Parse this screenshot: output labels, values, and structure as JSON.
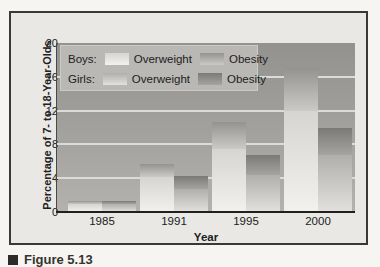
{
  "figure": {
    "caption": "Figure 5.13",
    "caption_marker": "square-bullet"
  },
  "chart_data": {
    "type": "bar",
    "stacked": true,
    "title": "",
    "xlabel": "Year",
    "ylabel": "Percentage of 7- to 18-Year-Olds",
    "categories": [
      "1985",
      "1991",
      "1995",
      "2000"
    ],
    "yticks": [
      0,
      4,
      8,
      12,
      16,
      20
    ],
    "ylim": [
      0,
      20
    ],
    "grid": "horizontal light lines at 4, 8, 12, 16",
    "legend_position": "top-left inside plot",
    "legend_rows": [
      {
        "group_label": "Boys:",
        "items": [
          {
            "label": "Overweight",
            "series_key": "boys_overweight"
          },
          {
            "label": "Obesity",
            "series_key": "boys_obesity"
          }
        ]
      },
      {
        "group_label": "Girls:",
        "items": [
          {
            "label": "Overweight",
            "series_key": "girls_overweight"
          },
          {
            "label": "Obesity",
            "series_key": "girls_obesity"
          }
        ]
      }
    ],
    "series": [
      {
        "name": "Boys Overweight",
        "key": "boys_overweight",
        "stack": "boys",
        "order": 0,
        "values": [
          0.9,
          4.2,
          7.4,
          12.0
        ],
        "color_top": "#d6d5d1",
        "color_bottom": "#f2f1ed"
      },
      {
        "name": "Boys Obesity",
        "key": "boys_obesity",
        "stack": "boys",
        "order": 1,
        "values": [
          0.4,
          1.5,
          3.2,
          5.0
        ],
        "color_top": "#94938f",
        "color_bottom": "#cbcac6"
      },
      {
        "name": "Girls Overweight",
        "key": "girls_overweight",
        "stack": "girls",
        "order": 0,
        "values": [
          0.9,
          2.7,
          4.4,
          6.8
        ],
        "color_top": "#b0afab",
        "color_bottom": "#e2e1dd"
      },
      {
        "name": "Girls Obesity",
        "key": "girls_obesity",
        "stack": "girls",
        "order": 1,
        "values": [
          0.4,
          1.6,
          2.4,
          3.1
        ],
        "color_top": "#7b7a77",
        "color_bottom": "#a5a4a0"
      }
    ]
  },
  "colors": {
    "page_bg": "#f6f5f2",
    "paper": "#e9e8e4",
    "frame_border": "#3a3936",
    "plot_bg_top": "#93928f",
    "plot_bg_bottom": "#b4b2ae",
    "legend_bg": "#b9b8b4",
    "gridline": "#dcdbd7",
    "baseline": "#21201e",
    "text": "#21201e"
  }
}
